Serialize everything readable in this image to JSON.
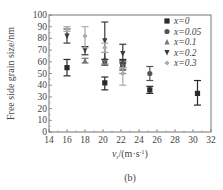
{
  "chart_data": {
    "type": "scatter",
    "subtitle": "(b)",
    "xlabel": "v_r/(m·s^-1)",
    "ylabel": "Free side grain size/nm",
    "xlim": [
      14,
      32
    ],
    "ylim": [
      0,
      100
    ],
    "xticks": [
      14,
      16,
      18,
      20,
      22,
      24,
      26,
      28,
      30,
      32
    ],
    "yticks": [
      0,
      10,
      20,
      30,
      40,
      50,
      60,
      70,
      80,
      90,
      100
    ],
    "grid": false,
    "legend_position": "upper right",
    "error_bars": true,
    "series": [
      {
        "name": "x=0",
        "marker": "square",
        "color": "#2a2a2a",
        "points": [
          {
            "x": 16,
            "y": 55,
            "lo": 48,
            "hi": 62
          },
          {
            "x": 20.2,
            "y": 42,
            "lo": 36,
            "hi": 47
          },
          {
            "x": 22.2,
            "y": 57,
            "lo": 53,
            "hi": 62
          },
          {
            "x": 25.2,
            "y": 36,
            "lo": 33,
            "hi": 39
          },
          {
            "x": 30.5,
            "y": 33,
            "lo": 23,
            "hi": 44
          }
        ]
      },
      {
        "name": "x=0.05",
        "marker": "circle",
        "color": "#555555",
        "points": [
          {
            "x": 20.2,
            "y": 60,
            "lo": 57,
            "hi": 62
          },
          {
            "x": 22.2,
            "y": 58,
            "lo": 55,
            "hi": 61
          },
          {
            "x": 25.2,
            "y": 50,
            "lo": 44,
            "hi": 56
          }
        ]
      },
      {
        "name": "x=0.1",
        "marker": "triangle-up",
        "color": "#777777",
        "points": [
          {
            "x": 18,
            "y": 61,
            "lo": 59,
            "hi": 63
          },
          {
            "x": 20.2,
            "y": 63,
            "lo": 58,
            "hi": 68
          },
          {
            "x": 22.2,
            "y": 55,
            "lo": 50,
            "hi": 60
          }
        ]
      },
      {
        "name": "x=0.2",
        "marker": "triangle-down",
        "color": "#3a3a3a",
        "points": [
          {
            "x": 16,
            "y": 82,
            "lo": 76,
            "hi": 88
          },
          {
            "x": 18,
            "y": 70,
            "lo": 66,
            "hi": 73
          },
          {
            "x": 20.2,
            "y": 78,
            "lo": 62,
            "hi": 94
          },
          {
            "x": 22.2,
            "y": 67,
            "lo": 59,
            "hi": 75
          }
        ]
      },
      {
        "name": "x=0.3",
        "marker": "diamond",
        "color": "#aaaaaa",
        "points": [
          {
            "x": 16,
            "y": 88,
            "lo": 86,
            "hi": 90
          },
          {
            "x": 18,
            "y": 82,
            "lo": 72,
            "hi": 90
          },
          {
            "x": 20.2,
            "y": 72,
            "lo": 68,
            "hi": 76
          },
          {
            "x": 22.2,
            "y": 50,
            "lo": 40,
            "hi": 55
          }
        ]
      }
    ]
  }
}
